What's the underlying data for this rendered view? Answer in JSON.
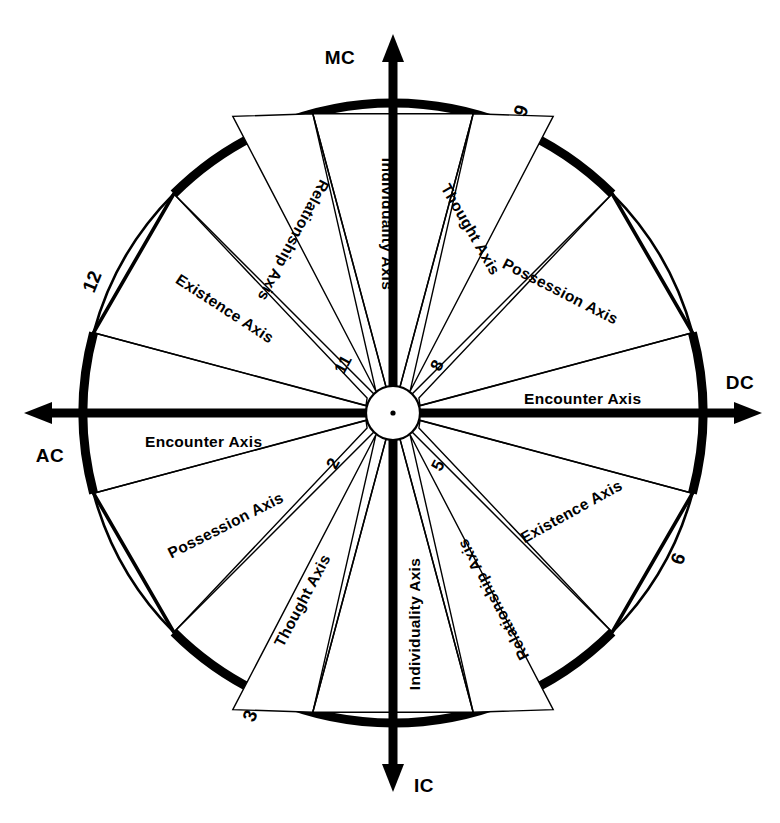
{
  "diagram": {
    "type": "astrological-axis-wheel",
    "center": {
      "x": 393,
      "y": 413
    },
    "outer_radius": 310,
    "inner_radius": 27,
    "background_color": "#ffffff",
    "ink_color": "#000000"
  },
  "cardinals": [
    {
      "id": "mc",
      "label": "MC",
      "position": "top",
      "angle_deg": 90,
      "text_x": 340,
      "text_y": 64
    },
    {
      "id": "dc",
      "label": "DC",
      "position": "right",
      "angle_deg": 0,
      "text_x": 722,
      "text_y": 389
    },
    {
      "id": "ic",
      "label": "IC",
      "position": "bottom",
      "angle_deg": 270,
      "text_x": 419,
      "text_y": 790
    },
    {
      "id": "ac",
      "label": "AC",
      "position": "left",
      "angle_deg": 180,
      "text_x": 36,
      "text_y": 462
    }
  ],
  "cusp_numbers": [
    {
      "label": "12",
      "x": 98,
      "y": 284,
      "rotate": -68
    },
    {
      "label": "9",
      "x": 527,
      "y": 113,
      "rotate": -68
    },
    {
      "label": "6",
      "x": 684,
      "y": 561,
      "rotate": -68
    },
    {
      "label": "3",
      "x": 256,
      "y": 718,
      "rotate": -68
    }
  ],
  "inner_numbers": [
    {
      "label": "11",
      "x": 348,
      "y": 367,
      "rotate": -62
    },
    {
      "label": "8",
      "x": 442,
      "y": 368,
      "rotate": -62
    },
    {
      "label": "5",
      "x": 443,
      "y": 468,
      "rotate": -62
    },
    {
      "label": "2",
      "x": 338,
      "y": 466,
      "rotate": -62
    }
  ],
  "cross_axis_labels": [
    {
      "label": "Encounter Axis",
      "x": 524,
      "y": 410,
      "anchor": "start",
      "rotate": 0,
      "side": "right"
    },
    {
      "label": "Encounter Axis",
      "x": 145,
      "y": 447,
      "anchor": "start",
      "rotate": 0,
      "side": "left"
    }
  ],
  "sectors": [
    {
      "id": "s11",
      "label": "Relationship Axis",
      "start_deg": 105,
      "end_deg": 135,
      "label_radius": 200,
      "label_rotate": -75
    },
    {
      "id": "s12",
      "label": "Existence Axis",
      "start_deg": 150,
      "end_deg": 180,
      "label_radius": 190,
      "label_rotate": -30
    },
    {
      "id": "s1",
      "label": "Individuality Axis",
      "start_deg": 75,
      "end_deg": 105,
      "label_radius": 205,
      "label_rotate": -90,
      "vertical": true
    },
    {
      "id": "s10",
      "label": "Thought Axis",
      "start_deg": 45,
      "end_deg": 75,
      "label_radius": 200,
      "label_rotate": -60
    },
    {
      "id": "s9",
      "label": "Possession Axis",
      "start_deg": 15,
      "end_deg": 45,
      "label_radius": 200,
      "label_rotate": -27
    },
    {
      "id": "s8",
      "label": "Existence Axis",
      "start_deg": 330,
      "end_deg": 360,
      "label_radius": 197,
      "label_rotate": 30
    },
    {
      "id": "s7",
      "label": "Relationship Axis",
      "start_deg": 285,
      "end_deg": 315,
      "label_radius": 200,
      "label_rotate": 62
    },
    {
      "id": "s6",
      "label": "Individuality Axis",
      "start_deg": 255,
      "end_deg": 285,
      "label_radius": 205,
      "label_rotate": 90,
      "vertical": true
    },
    {
      "id": "s5",
      "label": "Thought Axis",
      "start_deg": 225,
      "end_deg": 255,
      "label_radius": 200,
      "label_rotate": 62
    },
    {
      "id": "s4",
      "label": "Possession Axis",
      "start_deg": 195,
      "end_deg": 225,
      "label_radius": 200,
      "label_rotate": 28
    }
  ],
  "axis_label_texts": {
    "individuality": "Individuality Axis",
    "thought": "Thought Axis",
    "possession": "Possession Axis",
    "encounter": "Encounter Axis",
    "existence": "Existence Axis",
    "relationship": "Relationship Axis"
  }
}
